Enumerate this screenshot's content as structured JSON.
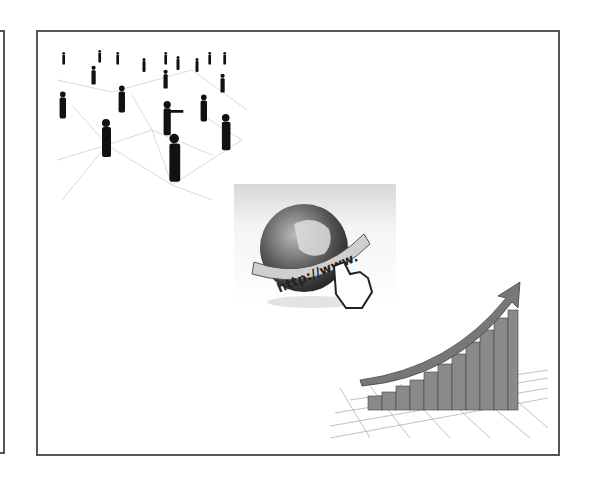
{
  "slide": {
    "illustrations": [
      {
        "name": "people-network",
        "description": "silhouettes of people connected by network lines"
      },
      {
        "name": "internet-globe",
        "description": "globe with url banner and pointing hand",
        "banner_text": "http://www."
      },
      {
        "name": "growth-chart",
        "description": "rising 3D bar chart with upward arrow on grid"
      }
    ]
  },
  "colors": {
    "frame": "#555555",
    "background": "#ffffff",
    "silhouette": "#111111"
  }
}
